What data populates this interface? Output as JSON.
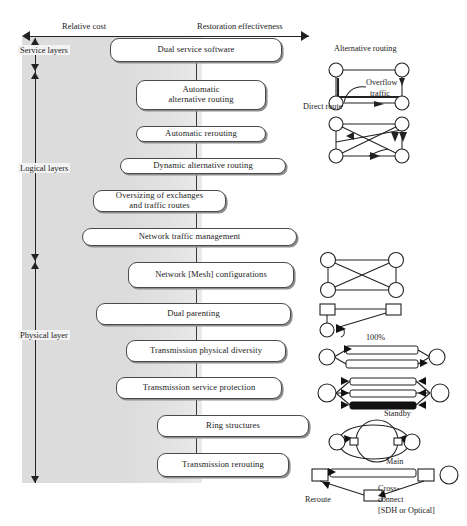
{
  "figure": {
    "axes": {
      "horizontal": {
        "left_label": "Relative cost",
        "right_label": "Restoration effectiveness",
        "left_arrow": "arrow-left-icon",
        "right_arrow": "arrow-right-icon"
      },
      "vertical_bands": [
        {
          "label": "Service layers"
        },
        {
          "label": "Logical layers"
        },
        {
          "label": "Physical layer"
        }
      ]
    },
    "ladder": [
      {
        "label": "Dual service software",
        "band": "service"
      },
      {
        "label": "Automatic\nalternative routing",
        "band": "service",
        "line1": "Automatic",
        "line2": "alternative routing"
      },
      {
        "label": "Automatic rerouting",
        "band": "logical"
      },
      {
        "label": "Dynamic alternative routing",
        "band": "logical"
      },
      {
        "label": "Oversizing of exchanges\nand traffic routes",
        "band": "logical",
        "line1": "Oversizing of exchanges",
        "line2": "and traffic routes"
      },
      {
        "label": "Network traffic management",
        "band": "logical"
      },
      {
        "label": "Network [Mesh] configurations",
        "band": "physical"
      },
      {
        "label": "Dual parenting",
        "band": "physical"
      },
      {
        "label": "Transmission physical diversity",
        "band": "physical"
      },
      {
        "label": "Transmission service protection",
        "band": "physical"
      },
      {
        "label": "Ring structures",
        "band": "physical"
      },
      {
        "label": "Transmission rerouting",
        "band": "physical"
      }
    ],
    "sketches": {
      "alternative_routing": {
        "title": "Alternative routing",
        "annotations": [
          "Overflow",
          "traffic",
          "Direct route"
        ]
      },
      "mesh": {
        "title": ""
      },
      "dual_parenting": {
        "title": ""
      },
      "physical_diversity": {
        "title": "100%"
      },
      "service_protection": {
        "title": "Standby"
      },
      "ring": {
        "title": ""
      },
      "transmission_rerouting": {
        "main": "Main",
        "reroute": "Reroute",
        "crossconnect_line1": "Cross-",
        "crossconnect_line2": "connect",
        "crossconnect_line3": "[SDH or Optical]"
      }
    },
    "colors": {
      "wash": "#dcdcdc",
      "ink": "#222222",
      "box_border": "#4a4a4a",
      "box_shadow": "#8e8e8e"
    }
  }
}
